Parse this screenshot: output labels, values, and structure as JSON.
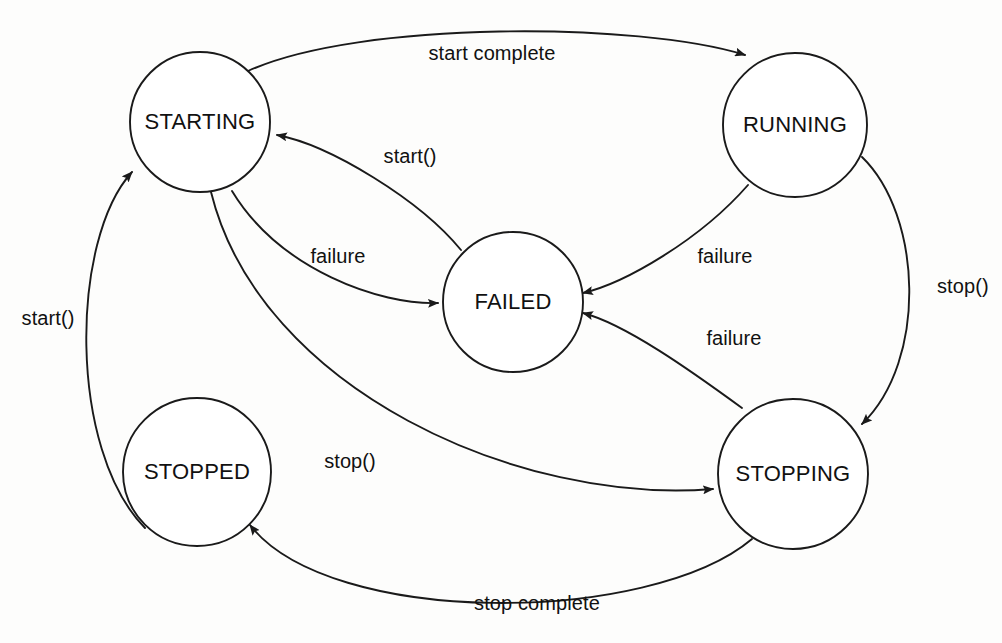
{
  "diagram": {
    "kind": "state-machine",
    "canvas": {
      "width": 1002,
      "height": 643
    },
    "colors": {
      "background": "#fdfdfc",
      "stroke": "#1a1a1a",
      "node_fill": "#ffffff",
      "text": "#111111"
    },
    "nodes": [
      {
        "id": "starting",
        "label": "STARTING",
        "cx": 200,
        "cy": 122,
        "r": 70
      },
      {
        "id": "running",
        "label": "RUNNING",
        "cx": 795,
        "cy": 125,
        "r": 72
      },
      {
        "id": "failed",
        "label": "FAILED",
        "cx": 513,
        "cy": 302,
        "r": 70
      },
      {
        "id": "stopped",
        "label": "STOPPED",
        "cx": 197,
        "cy": 472,
        "r": 74
      },
      {
        "id": "stopping",
        "label": "STOPPING",
        "cx": 793,
        "cy": 474,
        "r": 75
      }
    ],
    "edges": [
      {
        "id": "starting-running",
        "label": "start complete",
        "from": "starting",
        "to": "running",
        "path": "M 248 71 C 360 20 640 22 745 55",
        "label_x": 492,
        "label_y": 55,
        "label_anchor": "middle"
      },
      {
        "id": "failed-starting",
        "label": "start()",
        "from": "failed",
        "to": "starting",
        "path": "M 461 250 C 420 200 330 145 277 135",
        "label_x": 410,
        "label_y": 158,
        "label_anchor": "middle"
      },
      {
        "id": "starting-failed",
        "label": "failure",
        "from": "starting",
        "to": "failed",
        "path": "M 232 191 C 280 270 380 305 438 303",
        "label_x": 338,
        "label_y": 258,
        "label_anchor": "middle"
      },
      {
        "id": "running-failed",
        "label": "failure",
        "from": "running",
        "to": "failed",
        "path": "M 748 185 C 700 240 625 283 583 293",
        "label_x": 725,
        "label_y": 258,
        "label_anchor": "middle"
      },
      {
        "id": "running-stopping",
        "label": "stop()",
        "from": "running",
        "to": "stopping",
        "path": "M 862 157 C 922 215 928 360 862 424",
        "label_x": 937,
        "label_y": 288,
        "label_anchor": "start"
      },
      {
        "id": "stopping-failed",
        "label": "failure",
        "from": "stopping",
        "to": "failed",
        "path": "M 742 408 C 690 370 625 324 583 313",
        "label_x": 734,
        "label_y": 340,
        "label_anchor": "middle"
      },
      {
        "id": "starting-stopping",
        "label": "stop()",
        "from": "starting",
        "to": "stopping",
        "path": "M 211 192 C 260 390 520 505 713 489",
        "label_x": 350,
        "label_y": 463,
        "label_anchor": "middle"
      },
      {
        "id": "stopped-starting",
        "label": "start()",
        "from": "stopped",
        "to": "starting",
        "path": "M 145 528 C 68 450 70 240 132 172",
        "label_x": 48,
        "label_y": 320,
        "label_anchor": "middle"
      },
      {
        "id": "stopping-stopped",
        "label": "stop complete",
        "from": "stopping",
        "to": "stopped",
        "path": "M 752 539 C 650 625 330 628 250 525",
        "label_x": 537,
        "label_y": 605,
        "label_anchor": "middle"
      }
    ]
  }
}
